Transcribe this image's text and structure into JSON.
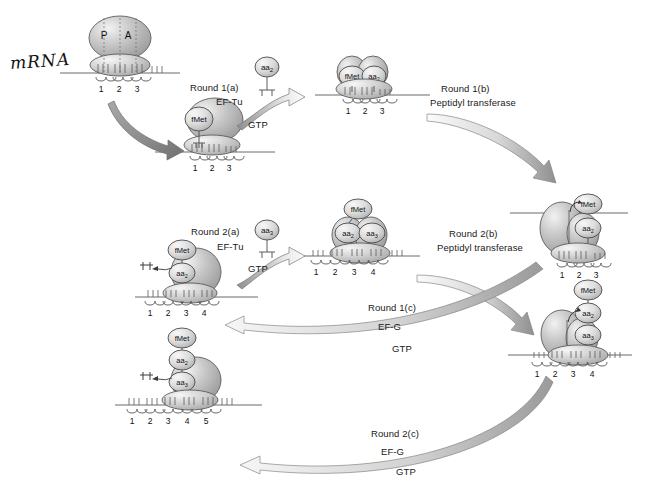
{
  "figure": {
    "mrna_label": "mRNA",
    "site_p": "P",
    "site_a": "A"
  },
  "colors": {
    "ribosome_large": "#b9b9b9",
    "ribosome_small": "#cfcfcf",
    "trna_fill": "#d6d6d6",
    "outline": "#4a4a4a",
    "arrow_dark": "#8c8c8c",
    "arrow_light": "#e2e2e2",
    "text": "#202020",
    "background": "#ffffff"
  },
  "steps": [
    {
      "id": "round-1a",
      "label_line1": "Round 1(a)",
      "label_line2": "EF-Tu",
      "label_line3": "GTP"
    },
    {
      "id": "round-1b",
      "label_line1": "Round 1(b)",
      "label_line2": "Peptidyl transferase",
      "label_line3": ""
    },
    {
      "id": "round-2a",
      "label_line1": "Round 2(a)",
      "label_line2": "EF-Tu",
      "label_line3": "GTP"
    },
    {
      "id": "round-2b",
      "label_line1": "Round 2(b)",
      "label_line2": "Peptidyl transferase",
      "label_line3": ""
    },
    {
      "id": "round-1c",
      "label_line1": "Round 1(c)",
      "label_line2": "EF-G",
      "label_line3": "GTP"
    },
    {
      "id": "round-2c",
      "label_line1": "Round 2(c)",
      "label_line2": "EF-G",
      "label_line3": "GTP"
    }
  ],
  "incoming_trnas": [
    {
      "id": "aa2-free",
      "label": "aa",
      "sub": "2"
    },
    {
      "id": "aa3-free",
      "label": "aa",
      "sub": "3"
    }
  ],
  "ribosomes": [
    {
      "id": "initiation-complex",
      "codons": [
        "1",
        "2",
        "3"
      ],
      "sites": [
        "P",
        "A"
      ],
      "peptide": []
    },
    {
      "id": "fmet-loaded",
      "codons": [
        "1",
        "2",
        "3"
      ],
      "sites": [],
      "peptide": [
        "fMet"
      ]
    },
    {
      "id": "fmet-aa2-bound",
      "codons": [
        "1",
        "2",
        "3"
      ],
      "sites": [],
      "peptide": [
        "fMet",
        "aa2"
      ]
    },
    {
      "id": "dipeptide-formed",
      "codons": [
        "1",
        "2",
        "3"
      ],
      "sites": [],
      "peptide": [
        "fMet",
        "aa2"
      ]
    },
    {
      "id": "translocated-round1",
      "codons": [
        "1",
        "2",
        "3",
        "4"
      ],
      "sites": [],
      "peptide": [
        "fMet",
        "aa2"
      ]
    },
    {
      "id": "fmet-aa2-aa3-bound",
      "codons": [
        "1",
        "2",
        "3",
        "4"
      ],
      "sites": [],
      "peptide": [
        "fMet",
        "aa2",
        "aa3"
      ]
    },
    {
      "id": "tripeptide-formed",
      "codons": [
        "1",
        "2",
        "3",
        "4"
      ],
      "sites": [],
      "peptide": [
        "fMet",
        "aa2",
        "aa3"
      ]
    },
    {
      "id": "translocated-round2",
      "codons": [
        "1",
        "2",
        "3",
        "4",
        "5"
      ],
      "sites": [],
      "peptide": [
        "fMet",
        "aa2",
        "aa3"
      ]
    }
  ],
  "peptide_labels": {
    "fmet": "fMet",
    "aa_base": "aa",
    "sub2": "2",
    "sub3": "3"
  }
}
